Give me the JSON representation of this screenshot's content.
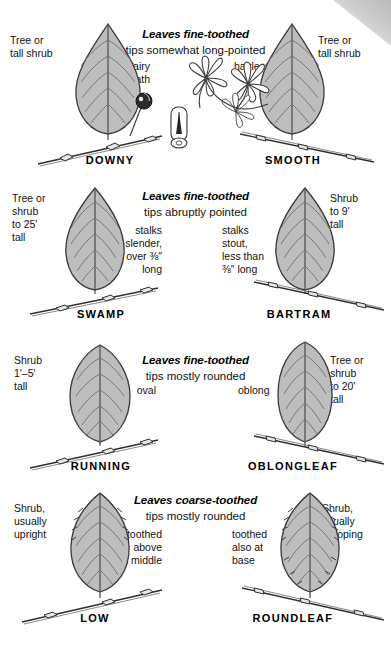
{
  "guide": {
    "type": "botanical-identification-chart",
    "subject": "Leaf and twig identification key",
    "colors": {
      "leaf_fill": "#bdbdbd",
      "leaf_outline": "#3a3a3a",
      "text": "#111111",
      "corner": "#c8c8c8"
    }
  },
  "rows": [
    {
      "id": "row-1",
      "heading": "Leaves fine-toothed",
      "subheading": "tips somewhat long-pointed",
      "left": {
        "species": "DOWNY",
        "habit": "Tree or\ntall shrub",
        "trait": "hairy\nbeneath",
        "leaf_shape": "ovate-acuminate"
      },
      "right": {
        "species": "SMOOTH",
        "habit": "Tree or\ntall shrub",
        "trait": "hairless",
        "leaf_shape": "ovate-acuminate"
      },
      "center_art": [
        "berry-on-stalk",
        "twig-cross-section",
        "flower-cluster"
      ]
    },
    {
      "id": "row-2",
      "heading": "Leaves fine-toothed",
      "subheading": "tips abruptly pointed",
      "left": {
        "species": "SWAMP",
        "habit": "Tree or\nshrub\nto 25'\ntall",
        "trait": "stalks\nslender,\nover ⅜″\nlong",
        "leaf_shape": "ovate"
      },
      "right": {
        "species": "BARTRAM",
        "habit": "Shrub\nto 9'\ntall",
        "trait": "stalks\nstout,\nless than\n⅜″ long",
        "leaf_shape": "ovate"
      }
    },
    {
      "id": "row-3",
      "heading": "Leaves fine-toothed",
      "subheading": "tips mostly rounded",
      "left": {
        "species": "RUNNING",
        "habit": "Shrub\n1'–5'\ntall",
        "trait": "oval",
        "leaf_shape": "oval"
      },
      "right": {
        "species": "OBLONGLEAF",
        "habit": "Tree or\nshrub\nto 20'\ntall",
        "trait": "oblong",
        "leaf_shape": "oblong"
      }
    },
    {
      "id": "row-4",
      "heading": "Leaves coarse-toothed",
      "subheading": "tips mostly rounded",
      "left": {
        "species": "LOW",
        "habit": "Shrub,\nusually\nupright",
        "trait": "toothed\nabove\nmiddle",
        "leaf_shape": "obovate"
      },
      "right": {
        "species": "ROUNDLEAF",
        "habit": "Shrub,\nusually\ndrooping",
        "trait": "toothed\nalso at\nbase",
        "leaf_shape": "obovate"
      }
    }
  ]
}
